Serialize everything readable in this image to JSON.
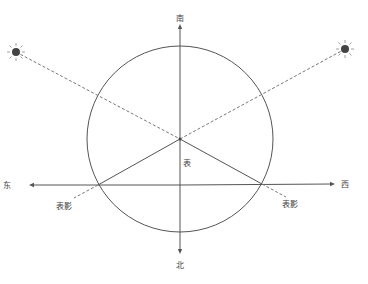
{
  "diagram": {
    "type": "gnomon-shadow-direction",
    "directions": {
      "south": "南",
      "north": "北",
      "east": "东",
      "west": "西"
    },
    "gnomon_label": "表",
    "shadow_labels": [
      "表影",
      "表影"
    ],
    "colors": {
      "line": "#555555",
      "dashed": "#777777",
      "sun": "#444444",
      "text": "#444444"
    }
  }
}
